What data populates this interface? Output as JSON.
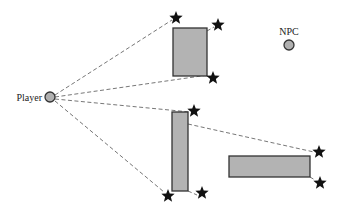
{
  "diagram": {
    "type": "visibility-diagram",
    "player": {
      "label": "Player",
      "x": 50,
      "y": 97,
      "r": 5
    },
    "npc": {
      "label": "NPC",
      "x": 289,
      "y": 45,
      "r": 5
    },
    "obstacles": [
      {
        "id": "top-block",
        "x": 173,
        "y": 28,
        "w": 34,
        "h": 48
      },
      {
        "id": "tall-block",
        "x": 172,
        "y": 112,
        "w": 16,
        "h": 79
      },
      {
        "id": "wide-block",
        "x": 229,
        "y": 156,
        "w": 81,
        "h": 21
      }
    ],
    "stars": [
      {
        "x": 176,
        "y": 18
      },
      {
        "x": 218,
        "y": 25
      },
      {
        "x": 213,
        "y": 78
      },
      {
        "x": 194,
        "y": 111
      },
      {
        "x": 168,
        "y": 196
      },
      {
        "x": 202,
        "y": 193
      },
      {
        "x": 319,
        "y": 152
      },
      {
        "x": 320,
        "y": 183
      }
    ],
    "sight_lines": [
      {
        "from": [
          55,
          95
        ],
        "to": [
          172,
          20
        ]
      },
      {
        "from": [
          55,
          97
        ],
        "to": [
          208,
          75
        ]
      },
      {
        "from": [
          55,
          99
        ],
        "to": [
          190,
          112
        ]
      },
      {
        "from": [
          55,
          101
        ],
        "to": [
          164,
          192
        ]
      },
      {
        "from": [
          207,
          76
        ],
        "to": [
          211,
          77
        ]
      },
      {
        "from": [
          207,
          31
        ],
        "to": [
          214,
          27
        ]
      },
      {
        "from": [
          188,
          124
        ],
        "to": [
          314,
          152
        ]
      },
      {
        "from": [
          188,
          191
        ],
        "to": [
          197,
          195
        ]
      },
      {
        "from": [
          310,
          177
        ],
        "to": [
          315,
          180
        ]
      }
    ],
    "colors": {
      "obstacle_fill": "#b3b3b3",
      "outline": "#333333",
      "sight_line": "#777777",
      "star": "#111111"
    }
  }
}
